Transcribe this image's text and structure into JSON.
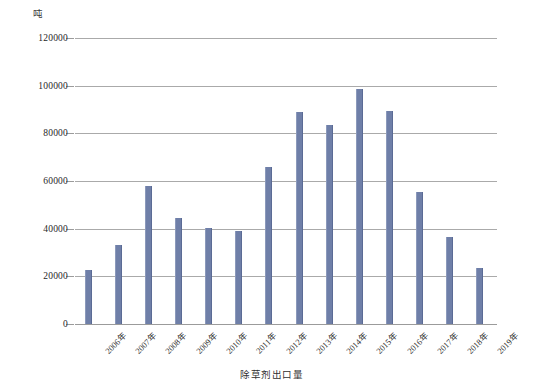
{
  "chart_data": {
    "type": "bar",
    "title": "",
    "subtitle": "",
    "xlabel": "",
    "ylabel": "吨",
    "unit_label": "吨",
    "legend_label": "除草剂出口量",
    "legend_position": "bottom-center",
    "grid": true,
    "ylim": [
      0,
      120000
    ],
    "ytick_step": 20000,
    "ytick_labels": [
      "120000",
      "100000",
      "80000",
      "60000",
      "40000",
      "20000",
      "0"
    ],
    "ytick_values": [
      120000,
      100000,
      80000,
      60000,
      40000,
      20000,
      0
    ],
    "categories": [
      "2006年",
      "2007年",
      "2008年",
      "2009年",
      "2010年",
      "2011年",
      "2012年",
      "2013年",
      "2014年",
      "2015年",
      "2016年",
      "2017年",
      "2018年",
      "2019年"
    ],
    "values": [
      22700,
      33000,
      57700,
      44500,
      40300,
      39000,
      66000,
      88800,
      83500,
      98500,
      89500,
      55300,
      36700,
      23500
    ],
    "series": [
      {
        "name": "除草剂出口量",
        "color": "#6f7fa8",
        "values": [
          22700,
          33000,
          57700,
          44500,
          40300,
          39000,
          66000,
          88800,
          83500,
          98500,
          89500,
          55300,
          36700,
          23500
        ]
      }
    ]
  },
  "colors": {
    "bar": "#6f7fa8",
    "gridline": "#9b9b9b",
    "background": "#ffffff",
    "text": "#2b2b2b"
  }
}
